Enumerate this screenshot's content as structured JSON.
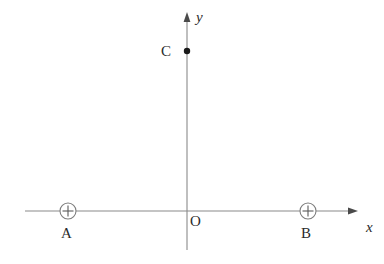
{
  "figure": {
    "title": "",
    "background_color": "#ffffff",
    "line_color": "#8a8a8a",
    "text_color": "#2b2b2b",
    "width": 384,
    "height": 264
  },
  "axes": {
    "x_axis": {
      "label": "x",
      "start_x": 25,
      "end_x": 358,
      "y": 211,
      "arrow": "right"
    },
    "y_axis": {
      "label": "y",
      "x": 187,
      "start_y": 250,
      "end_y": 12,
      "arrow": "up"
    },
    "origin": {
      "label": "O",
      "x": 187,
      "y": 211
    }
  },
  "charges": [
    {
      "name": "A",
      "label": "A",
      "sign": "+",
      "symbol": "circled-plus",
      "x": 68,
      "y": 211,
      "radius": 8
    },
    {
      "name": "B",
      "label": "B",
      "sign": "+",
      "symbol": "circled-plus",
      "x": 308,
      "y": 211,
      "radius": 8
    }
  ],
  "points": [
    {
      "name": "C",
      "label": "C",
      "symbol": "filled-dot",
      "x": 187,
      "y": 51,
      "radius": 3
    }
  ]
}
